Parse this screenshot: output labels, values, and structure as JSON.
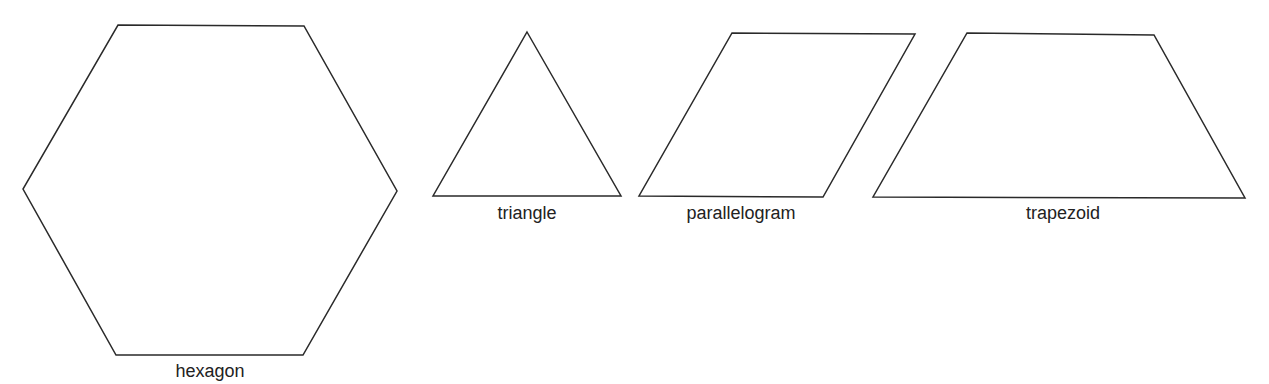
{
  "shapes": [
    {
      "name": "hexagon",
      "label": "hexagon",
      "points": "118,25 304,26 397,191 303,355 116,355 23,189",
      "label_pos": {
        "x": 210,
        "y": 362
      }
    },
    {
      "name": "triangle",
      "label": "triangle",
      "points": "527,32 621,196 433,196",
      "label_pos": {
        "x": 527,
        "y": 204
      }
    },
    {
      "name": "parallelogram",
      "label": "parallelogram",
      "points": "732,33 915,34 823,197 639,196",
      "label_pos": {
        "x": 741,
        "y": 204
      }
    },
    {
      "name": "trapezoid",
      "label": "trapezoid",
      "points": "967,33 1154,35 1245,198 873,197",
      "label_pos": {
        "x": 1063,
        "y": 204
      }
    }
  ],
  "colors": {
    "stroke": "#2a2a2a",
    "background": "#ffffff"
  }
}
